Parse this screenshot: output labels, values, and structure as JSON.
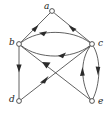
{
  "figure": {
    "width": 107,
    "height": 116,
    "background_color": "#ffffff",
    "edge_color": "#3a3a3a",
    "node_fill_color": "#ffffff",
    "node_stroke_color": "#2b2b2b",
    "label_color": "#1a1a1a"
  },
  "nodes": [
    {
      "id": "a",
      "label": "a",
      "x": 52,
      "y": 11,
      "r": 2.4,
      "label_x": 44,
      "label_y": 9
    },
    {
      "id": "b",
      "label": "b",
      "x": 19,
      "y": 44,
      "r": 2.4,
      "label_x": 9,
      "label_y": 45
    },
    {
      "id": "c",
      "label": "c",
      "x": 92,
      "y": 44,
      "r": 2.4,
      "label_x": 98,
      "label_y": 46
    },
    {
      "id": "d",
      "label": "d",
      "x": 19,
      "y": 101,
      "r": 2.4,
      "label_x": 9,
      "label_y": 102
    },
    {
      "id": "e",
      "label": "e",
      "x": 92,
      "y": 101,
      "r": 2.4,
      "label_x": 98,
      "label_y": 104
    }
  ],
  "edges": [
    {
      "id": "a-to-b",
      "from": "a",
      "to": "b",
      "style": "straight",
      "arrow_at": "middle"
    },
    {
      "id": "c-to-a",
      "from": "c",
      "to": "a",
      "style": "straight",
      "arrow_at": "middle"
    },
    {
      "id": "c-to-b",
      "from": "c",
      "to": "b",
      "style": "curved-up",
      "arrow_at": "middle"
    },
    {
      "id": "b-to-c",
      "from": "b",
      "to": "c",
      "style": "curved-down",
      "arrow_at": "middle"
    },
    {
      "id": "b-to-d",
      "from": "b",
      "to": "d",
      "style": "straight",
      "arrow_at": "middle"
    },
    {
      "id": "d-to-c",
      "from": "d",
      "to": "c",
      "style": "straight",
      "arrow_at": "middle"
    },
    {
      "id": "e-to-b",
      "from": "e",
      "to": "b",
      "style": "straight",
      "arrow_at": "middle"
    },
    {
      "id": "e-to-c",
      "from": "e",
      "to": "c",
      "style": "curved-left",
      "arrow_at": "middle"
    },
    {
      "id": "c-to-e",
      "from": "c",
      "to": "e",
      "style": "curved-right",
      "arrow_at": "middle"
    }
  ]
}
